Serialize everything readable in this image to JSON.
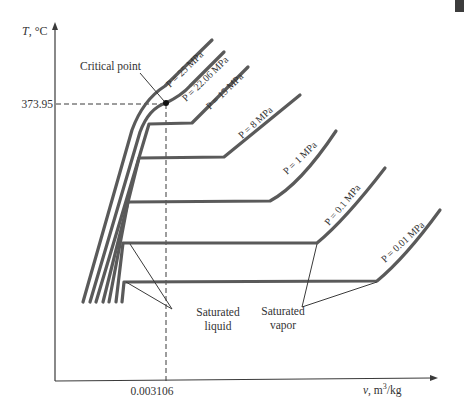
{
  "diagram": {
    "type": "T-v diagram of water at various pressures",
    "y_axis": {
      "label_var": "T",
      "label_unit": ", °C"
    },
    "x_axis": {
      "label_var": "v",
      "label_unit": ", m",
      "label_sup": "3",
      "label_tail": "/kg"
    },
    "critical_point": {
      "label": "Critical point",
      "temperature": "373.95",
      "specific_volume": "0.003106"
    },
    "isobars": [
      {
        "label": "P = 25 MPa",
        "pressure_mpa": 25
      },
      {
        "label": "P = 22.06 MPa",
        "pressure_mpa": 22.06
      },
      {
        "label": "P = 15 MPa",
        "pressure_mpa": 15
      },
      {
        "label": "P = 8 MPa",
        "pressure_mpa": 8
      },
      {
        "label": "P = 1 MPa",
        "pressure_mpa": 1
      },
      {
        "label": "P = 0.1 MPa",
        "pressure_mpa": 0.1
      },
      {
        "label": "P = 0.01 MPa",
        "pressure_mpa": 0.01
      }
    ],
    "annotations": {
      "saturated_liquid_line1": "Saturated",
      "saturated_liquid_line2": "liquid",
      "saturated_vapor_line1": "Saturated",
      "saturated_vapor_line2": "vapor"
    },
    "colors": {
      "curve": "#5a5a5a",
      "axis": "#3a3a3a",
      "text": "#333333",
      "background": "#ffffff"
    }
  }
}
